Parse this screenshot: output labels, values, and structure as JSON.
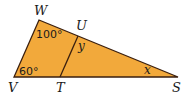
{
  "figure": {
    "fill_color": "#F2A93B",
    "stroke_color": "#3a1f0f",
    "vertices": {
      "W": {
        "label": "W",
        "x": 39,
        "y": 20
      },
      "V": {
        "label": "V",
        "x": 14,
        "y": 77
      },
      "S": {
        "label": "S",
        "x": 178,
        "y": 77
      },
      "U": {
        "label": "U",
        "x": 78,
        "y": 36
      },
      "T": {
        "label": "T",
        "x": 60,
        "y": 77
      }
    },
    "angles": {
      "W": "100°",
      "V": "60°",
      "U": "y",
      "S": "x"
    }
  }
}
